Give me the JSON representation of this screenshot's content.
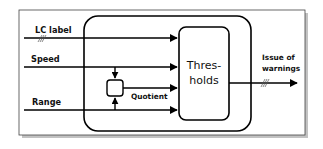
{
  "diagram": {
    "inputs": [
      {
        "label": "LC label",
        "y": 38,
        "hatched": true
      },
      {
        "label": "Speed",
        "y": 67,
        "hatched": false
      },
      {
        "label": "Range",
        "y": 110,
        "hatched": false
      }
    ],
    "combiner": {
      "output_label": "Quotient"
    },
    "thresholds_box": {
      "line1": "Thres-",
      "line2": "holds"
    },
    "output": {
      "line1": "Issue of",
      "line2": "warnings",
      "hatched": true
    },
    "colors": {
      "stroke": "#000000",
      "frame": "#333333",
      "shadow": "#9a9a9a",
      "background": "#ffffff"
    }
  }
}
